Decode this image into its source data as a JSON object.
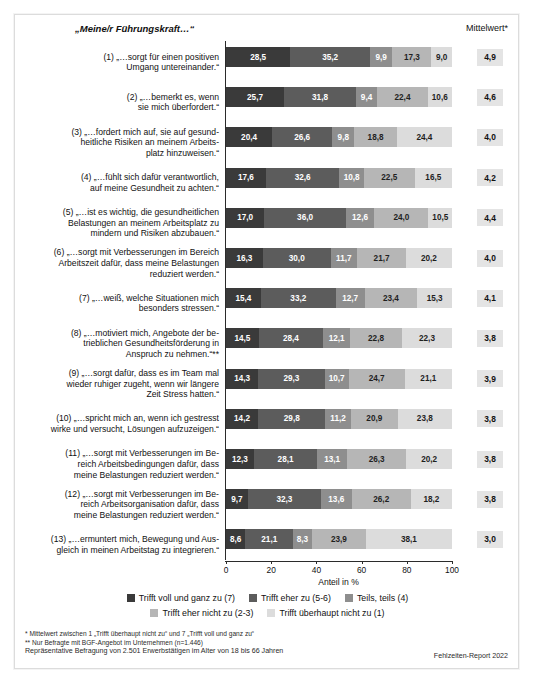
{
  "header": {
    "title": "„Meine/r Führungskraft…“",
    "mean_column_header": "Mittelwert*"
  },
  "axis": {
    "title": "Anteil in %",
    "ticks": [
      "0",
      "20",
      "40",
      "60",
      "80",
      "100"
    ]
  },
  "legend": {
    "items": [
      {
        "label": "Trifft voll und ganz zu (7)",
        "color": "#3a3a3a"
      },
      {
        "label": "Trifft eher zu (5-6)",
        "color": "#5c5c5c"
      },
      {
        "label": "Teils, teils (4)",
        "color": "#8e8e8e"
      },
      {
        "label": "Trifft eher nicht zu (2-3)",
        "color": "#b6b6b6"
      },
      {
        "label": "Trifft überhaupt nicht zu (1)",
        "color": "#dcdcdc"
      }
    ]
  },
  "footnotes": {
    "line1": "*  Mittelwert zwischen 1 „Trifft überhaupt nicht zu“ und 7 „Trifft voll und ganz zu“",
    "line2": "** Nur Befragte mit BGF-Angebot im Unternehmen (n=1.446)",
    "line3": "Repräsentative Befragung von 2.501 Erwerbstätigen im Alter von 18 bis 66 Jahren",
    "source": "Fehlzeiten-Report 2022"
  },
  "chart_data": {
    "type": "bar",
    "subtype": "stacked-horizontal-100",
    "title": "„Meine/r Führungskraft…“",
    "xlabel": "Anteil in %",
    "ylabel": "",
    "xlim": [
      0,
      100
    ],
    "grid": false,
    "legend_position": "bottom",
    "series": [
      {
        "name": "Trifft voll und ganz zu (7)",
        "color": "#3a3a3a",
        "values": [
          28.5,
          25.7,
          20.4,
          17.6,
          17.0,
          16.3,
          15.4,
          14.5,
          14.3,
          14.2,
          12.3,
          9.7,
          8.6
        ]
      },
      {
        "name": "Trifft eher zu (5-6)",
        "color": "#5c5c5c",
        "values": [
          35.2,
          31.8,
          26.6,
          32.6,
          36.0,
          30.0,
          33.2,
          28.4,
          29.3,
          29.8,
          28.1,
          32.3,
          21.1
        ]
      },
      {
        "name": "Teils, teils (4)",
        "color": "#8e8e8e",
        "values": [
          9.9,
          9.4,
          9.8,
          10.8,
          12.6,
          11.7,
          12.7,
          12.1,
          10.7,
          11.2,
          13.1,
          13.6,
          8.3
        ]
      },
      {
        "name": "Trifft eher nicht zu (2-3)",
        "color": "#b6b6b6",
        "values": [
          17.3,
          22.4,
          18.8,
          22.5,
          24.0,
          21.7,
          23.4,
          22.8,
          24.7,
          20.9,
          26.3,
          26.2,
          23.9
        ]
      },
      {
        "name": "Trifft überhaupt nicht zu (1)",
        "color": "#dcdcdc",
        "values": [
          9.0,
          10.6,
          24.4,
          16.5,
          10.5,
          20.2,
          15.3,
          22.3,
          21.1,
          23.8,
          20.2,
          18.2,
          38.1
        ]
      }
    ],
    "categories": [
      "(1) „…sorgt für einen positiven Umgang untereinander.“",
      "(2) „…bemerkt es, wenn sie mich überfordert.“",
      "(3) „…fordert mich auf, sie auf gesundheitliche Risiken an meinem Arbeitsplatz hinzuweisen.“",
      "(4) „…fühlt sich dafür verantwortlich, auf meine Gesundheit zu achten.“",
      "(5) „…ist es wichtig, die gesundheitlichen Belastungen an meinem Arbeitsplatz zu mindern und Risiken abzubauen.“",
      "(6) „…sorgt mit Verbesserungen im Bereich Arbeitszeit dafür, dass meine Belastungen reduziert werden.“",
      "(7) „…weiß, welche Situationen mich besonders stressen.“",
      "(8) „…motiviert mich, Angebote der betrieblichen Gesundheitsförderung in Anspruch zu nehmen.“**",
      "(9) „…sorgt dafür, dass es im Team mal wieder ruhiger zugeht, wenn wir längere Zeit Stress hatten.“",
      "(10) „…spricht mich an, wenn ich gestresst wirke und versucht, Lösungen aufzuzeigen.“",
      "(11) „…sorgt mit Verbesserungen im Bereich Arbeitsbedingungen dafür, dass meine Belastungen reduziert werden.“",
      "(12) „…sorgt mit Verbesserungen im Bereich Arbeitsorganisation dafür, dass meine Belastungen reduziert werden.“",
      "(13) „…ermuntert mich, Bewegung und Ausgleich in meinen Arbeitstag zu integrieren.“"
    ],
    "mean_label": "Mittelwert*",
    "means": [
      "4,9",
      "4,6",
      "4,0",
      "4,2",
      "4,4",
      "4,0",
      "4,1",
      "3,8",
      "3,9",
      "3,8",
      "3,8",
      "3,8",
      "3,0"
    ]
  },
  "rows": [
    {
      "label_lines": [
        "(1) „…sorgt für einen positiven",
        "Umgang untereinander.“"
      ],
      "values": [
        "28,5",
        "35,2",
        "9,9",
        "17,3",
        "9,0"
      ],
      "mean": "4,9"
    },
    {
      "label_lines": [
        "(2) „…bemerkt es, wenn",
        "sie mich überfordert.“"
      ],
      "values": [
        "25,7",
        "31,8",
        "9,4",
        "22,4",
        "10,6"
      ],
      "mean": "4,6"
    },
    {
      "label_lines": [
        "(3) „…fordert mich auf, sie auf gesund-",
        "heitliche Risiken an meinem Arbeits-",
        "platz hinzuweisen.“"
      ],
      "values": [
        "20,4",
        "26,6",
        "9,8",
        "18,8",
        "24,4"
      ],
      "mean": "4,0"
    },
    {
      "label_lines": [
        "(4) „…fühlt sich dafür verantwortlich,",
        "auf meine Gesundheit zu achten.“"
      ],
      "values": [
        "17,6",
        "32,6",
        "10,8",
        "22,5",
        "16,5"
      ],
      "mean": "4,2"
    },
    {
      "label_lines": [
        "(5) „…ist es wichtig, die gesundheitlichen",
        "Belastungen an meinem Arbeitsplatz zu",
        "mindern und Risiken abzubauen.“"
      ],
      "values": [
        "17,0",
        "36,0",
        "12,6",
        "24,0",
        "10,5"
      ],
      "mean": "4,4"
    },
    {
      "label_lines": [
        "(6) „…sorgt mit Verbesserungen im Bereich",
        "Arbeitszeit dafür, dass meine Belastungen",
        "reduziert werden.“"
      ],
      "values": [
        "16,3",
        "30,0",
        "11,7",
        "21,7",
        "20,2"
      ],
      "mean": "4,0"
    },
    {
      "label_lines": [
        "(7) „…weiß, welche Situationen mich",
        "besonders stressen.“"
      ],
      "values": [
        "15,4",
        "33,2",
        "12,7",
        "23,4",
        "15,3"
      ],
      "mean": "4,1"
    },
    {
      "label_lines": [
        "(8) „…motiviert mich, Angebote der be-",
        "trieblichen Gesundheitsförderung in",
        "Anspruch zu nehmen.“**"
      ],
      "values": [
        "14,5",
        "28,4",
        "12,1",
        "22,8",
        "22,3"
      ],
      "mean": "3,8"
    },
    {
      "label_lines": [
        "(9) „…sorgt dafür, dass es im Team mal",
        "wieder ruhiger zugeht, wenn wir längere",
        "Zeit Stress hatten.“"
      ],
      "values": [
        "14,3",
        "29,3",
        "10,7",
        "24,7",
        "21,1"
      ],
      "mean": "3,9"
    },
    {
      "label_lines": [
        "(10) „…spricht mich an, wenn ich gestresst",
        "wirke und versucht, Lösungen aufzuzeigen.“"
      ],
      "values": [
        "14,2",
        "29,8",
        "11,2",
        "20,9",
        "23,8"
      ],
      "mean": "3,8"
    },
    {
      "label_lines": [
        "(11) „…sorgt mit Verbesserungen im Be-",
        "reich Arbeitsbedingungen dafür, dass",
        "meine Belastungen reduziert werden.“"
      ],
      "values": [
        "12,3",
        "28,1",
        "13,1",
        "26,3",
        "20,2"
      ],
      "mean": "3,8"
    },
    {
      "label_lines": [
        "(12) „…sorgt mit Verbesserungen im Be-",
        "reich Arbeitsorganisation dafür, dass",
        "meine Belastungen reduziert werden.“"
      ],
      "values": [
        "9,7",
        "32,3",
        "13,6",
        "26,2",
        "18,2"
      ],
      "mean": "3,8"
    },
    {
      "label_lines": [
        "(13) „…ermuntert mich, Bewegung und Aus-",
        "gleich in meinen Arbeitstag zu integrieren.“"
      ],
      "values": [
        "8,6",
        "21,1",
        "8,3",
        "23,9",
        "38,1"
      ],
      "mean": "3,0"
    }
  ]
}
